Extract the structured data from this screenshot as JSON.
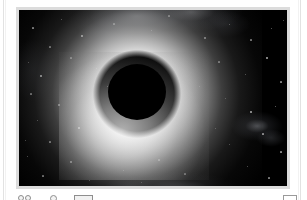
{
  "document": {
    "background_color": "#ffffff",
    "rule_color": "#e2e2e2"
  },
  "figure": {
    "frame_color": "#dcdcdc",
    "canvas_color": "#000000",
    "alt": "Black hole silhouette with bright glowing halo against a star field"
  },
  "toolbar": {
    "binoculars_label": "Observe",
    "circle_label": "Aperture",
    "bar_label": "Scale bar",
    "box_label": "Panel"
  },
  "chart_data": {
    "type": "heatmap",
    "xlabel": "",
    "ylabel": "",
    "colormap": "grayscale",
    "background": "#000000",
    "field_width": 268,
    "field_height": 176,
    "features": [
      {
        "name": "shadow-disk",
        "kind": "occulting-disk",
        "center_x": 118,
        "center_y": 82,
        "radius_x": 29,
        "radius_y": 28,
        "brightness": 0.0
      },
      {
        "name": "halo",
        "kind": "radial-glow",
        "center_x": 118,
        "center_y": 84,
        "inner_radius": 29,
        "outer_radius": 125,
        "peak_brightness": 0.92,
        "falloff": "radial"
      },
      {
        "name": "halo-hotspot",
        "kind": "radial-glow",
        "center_x": 112,
        "center_y": 110,
        "radius_x": 62,
        "radius_y": 50,
        "peak_brightness": 0.7
      },
      {
        "name": "nebula-top",
        "kind": "diffuse-cloud",
        "center_x": 118,
        "center_y": 6,
        "radius_x": 70,
        "radius_y": 26,
        "peak_brightness": 0.46
      },
      {
        "name": "nebula-right",
        "kind": "diffuse-cloud",
        "center_x": 238,
        "center_y": 116,
        "radius_x": 26,
        "radius_y": 15,
        "peak_brightness": 0.42
      },
      {
        "name": "nebula-bottom",
        "kind": "diffuse-cloud",
        "center_x": 160,
        "center_y": 178,
        "radius_x": 60,
        "radius_y": 16,
        "peak_brightness": 0.3
      }
    ],
    "stars": [
      {
        "x": 14,
        "y": 18,
        "r": 0.6,
        "b": 0.55
      },
      {
        "x": 42,
        "y": 9,
        "r": 0.5,
        "b": 0.45
      },
      {
        "x": 63,
        "y": 26,
        "r": 0.9,
        "b": 0.85
      },
      {
        "x": 31,
        "y": 37,
        "r": 0.6,
        "b": 0.5
      },
      {
        "x": 9,
        "y": 52,
        "r": 0.5,
        "b": 0.4
      },
      {
        "x": 52,
        "y": 48,
        "r": 0.6,
        "b": 0.52
      },
      {
        "x": 22,
        "y": 66,
        "r": 0.8,
        "b": 0.72
      },
      {
        "x": 77,
        "y": 58,
        "r": 0.5,
        "b": 0.42
      },
      {
        "x": 12,
        "y": 84,
        "r": 0.6,
        "b": 0.48
      },
      {
        "x": 40,
        "y": 95,
        "r": 0.7,
        "b": 0.6
      },
      {
        "x": 18,
        "y": 110,
        "r": 0.5,
        "b": 0.44
      },
      {
        "x": 60,
        "y": 118,
        "r": 0.9,
        "b": 0.88
      },
      {
        "x": 31,
        "y": 132,
        "r": 0.6,
        "b": 0.52
      },
      {
        "x": 8,
        "y": 146,
        "r": 0.5,
        "b": 0.4
      },
      {
        "x": 52,
        "y": 152,
        "r": 0.7,
        "b": 0.58
      },
      {
        "x": 24,
        "y": 166,
        "r": 0.6,
        "b": 0.48
      },
      {
        "x": 70,
        "y": 170,
        "r": 0.5,
        "b": 0.42
      },
      {
        "x": 95,
        "y": 14,
        "r": 0.6,
        "b": 0.5
      },
      {
        "x": 132,
        "y": 20,
        "r": 0.5,
        "b": 0.44
      },
      {
        "x": 150,
        "y": 6,
        "r": 0.6,
        "b": 0.52
      },
      {
        "x": 104,
        "y": 160,
        "r": 0.5,
        "b": 0.42
      },
      {
        "x": 140,
        "y": 150,
        "r": 0.6,
        "b": 0.5
      },
      {
        "x": 122,
        "y": 172,
        "r": 0.5,
        "b": 0.4
      },
      {
        "x": 166,
        "y": 164,
        "r": 0.6,
        "b": 0.48
      },
      {
        "x": 186,
        "y": 28,
        "r": 0.7,
        "b": 0.62
      },
      {
        "x": 210,
        "y": 14,
        "r": 0.5,
        "b": 0.44
      },
      {
        "x": 232,
        "y": 30,
        "r": 0.6,
        "b": 0.5
      },
      {
        "x": 252,
        "y": 18,
        "r": 0.5,
        "b": 0.42
      },
      {
        "x": 200,
        "y": 52,
        "r": 0.6,
        "b": 0.52
      },
      {
        "x": 226,
        "y": 64,
        "r": 0.5,
        "b": 0.44
      },
      {
        "x": 248,
        "y": 48,
        "r": 0.7,
        "b": 0.6
      },
      {
        "x": 262,
        "y": 72,
        "r": 0.6,
        "b": 0.5
      },
      {
        "x": 206,
        "y": 88,
        "r": 0.5,
        "b": 0.42
      },
      {
        "x": 232,
        "y": 102,
        "r": 0.8,
        "b": 0.74
      },
      {
        "x": 256,
        "y": 96,
        "r": 0.5,
        "b": 0.44
      },
      {
        "x": 244,
        "y": 124,
        "r": 0.6,
        "b": 0.5
      },
      {
        "x": 210,
        "y": 134,
        "r": 0.5,
        "b": 0.42
      },
      {
        "x": 262,
        "y": 142,
        "r": 0.6,
        "b": 0.52
      },
      {
        "x": 228,
        "y": 156,
        "r": 0.5,
        "b": 0.4
      },
      {
        "x": 250,
        "y": 168,
        "r": 0.6,
        "b": 0.48
      },
      {
        "x": 196,
        "y": 118,
        "r": 0.5,
        "b": 0.44
      },
      {
        "x": 180,
        "y": 76,
        "r": 0.5,
        "b": 0.38
      },
      {
        "x": 88,
        "y": 76,
        "r": 0.5,
        "b": 0.36
      },
      {
        "x": 264,
        "y": 10,
        "r": 0.5,
        "b": 0.4
      },
      {
        "x": 6,
        "y": 130,
        "r": 0.5,
        "b": 0.38
      }
    ]
  }
}
